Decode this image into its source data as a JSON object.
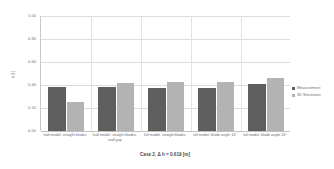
{
  "chart_data": {
    "type": "bar",
    "title": "",
    "xlabel": "Case 2, Δ h = 0.619 [m]",
    "ylabel": "η [-]",
    "ylim": [
      0.0,
      1.0
    ],
    "yticks": [
      "1.00",
      "0.80",
      "0.60",
      "0.40",
      "0.20",
      "0.00"
    ],
    "ytick_values": [
      1.0,
      0.8,
      0.6,
      0.4,
      0.2,
      0.0
    ],
    "grid": true,
    "legend_position": "right",
    "categories": [
      "half-model, straight blades",
      "half-model, straight blades, wall gap",
      "full model, straight blades",
      "full model, blade angle 10°",
      "full model, blade angle 20°"
    ],
    "series": [
      {
        "name": "Measurement",
        "color": "#5e5e5e",
        "values": [
          0.385,
          0.383,
          0.378,
          0.372,
          0.405
        ]
      },
      {
        "name": "3D Simulation",
        "color": "#b3b3b3",
        "values": [
          0.25,
          0.414,
          0.425,
          0.428,
          0.46
        ]
      }
    ]
  },
  "legend": {
    "items": [
      {
        "label": "Measurement",
        "color": "#5e5e5e"
      },
      {
        "label": "3D Simulation",
        "color": "#b3b3b3"
      }
    ]
  }
}
